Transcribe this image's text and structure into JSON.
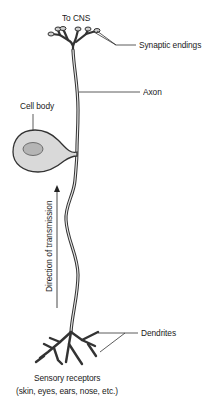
{
  "diagram": {
    "labels": {
      "to_cns": "To CNS",
      "synaptic_endings": "Synaptic endings",
      "axon": "Axon",
      "cell_body": "Cell body",
      "direction": "Direction of transmission",
      "dendrites": "Dendrites",
      "sensory_receptors": "Sensory receptors",
      "receptor_examples": "(skin, eyes, ears, nose, etc.)"
    },
    "colors": {
      "stroke": "#333333",
      "membrane_fill": "#d9d9d9",
      "nucleus_fill": "#b5b5b5",
      "text": "#1a1a1a",
      "background": "#ffffff"
    }
  }
}
